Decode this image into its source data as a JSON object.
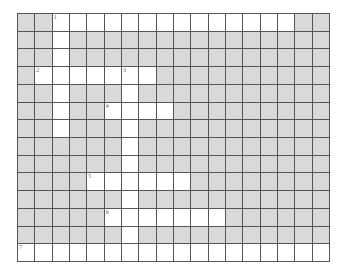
{
  "puzzle": {
    "cols": 18,
    "rows": 14,
    "colors": {
      "block": "#d9d9d9",
      "open": "#ffffff",
      "line": "#555555",
      "number": "#666666"
    },
    "open_cells": [
      [
        0,
        [
          2,
          3,
          4,
          5,
          6,
          7,
          8,
          9,
          10,
          11,
          12,
          13,
          14,
          15
        ]
      ],
      [
        1,
        [
          2
        ]
      ],
      [
        2,
        [
          2
        ]
      ],
      [
        3,
        [
          1,
          2,
          3,
          4,
          5,
          6,
          7
        ]
      ],
      [
        4,
        [
          2,
          6
        ]
      ],
      [
        5,
        [
          2,
          5,
          6,
          7,
          8
        ]
      ],
      [
        6,
        [
          2,
          6
        ]
      ],
      [
        7,
        [
          6
        ]
      ],
      [
        8,
        [
          6
        ]
      ],
      [
        9,
        [
          4,
          5,
          6,
          7,
          8,
          9
        ]
      ],
      [
        10,
        [
          6
        ]
      ],
      [
        11,
        [
          5,
          6,
          7,
          8,
          9,
          10,
          11
        ]
      ],
      [
        12,
        [
          6
        ]
      ],
      [
        13,
        [
          0,
          1,
          2,
          3,
          4,
          5,
          6,
          7,
          8,
          9,
          10,
          11,
          12,
          13,
          14,
          15,
          16,
          17
        ]
      ]
    ],
    "numbers": [
      {
        "label": "1",
        "row": 0,
        "col": 2
      },
      {
        "label": "2",
        "row": 3,
        "col": 1
      },
      {
        "label": "3",
        "row": 3,
        "col": 6
      },
      {
        "label": "4",
        "row": 5,
        "col": 5
      },
      {
        "label": "5",
        "row": 9,
        "col": 4
      },
      {
        "label": "6",
        "row": 11,
        "col": 5
      },
      {
        "label": "7",
        "row": 13,
        "col": 0
      }
    ]
  }
}
